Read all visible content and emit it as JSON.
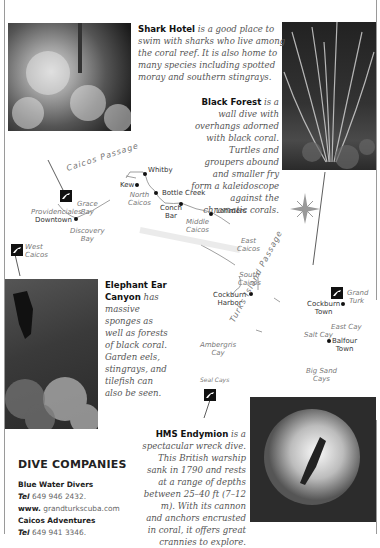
{
  "captions": {
    "shark_hotel": {
      "title": "Shark Hotel",
      "body": "is a good place to swim with sharks who live among the coral reef. It is also home to many species including spotted moray and southern stingrays."
    },
    "black_forest": {
      "title": "Black Forest",
      "body": "is a wall dive with overhangs adorned with black coral. Turtles and groupers abound and smaller fry form a kaleidoscope against the chromatic corals."
    },
    "elephant_ear": {
      "title": "Elephant Ear Canyon",
      "body": "has massive sponges as well as forests of black coral. Garden eels, stingrays, and tilefish can also be seen."
    },
    "hms_endymion": {
      "title": "HMS Endymion",
      "body": "is a spectacular wreck dive. This British warship sank in 1790 and rests at a range of depths between 25–40 ft (7–12 m). With its cannon and anchors encrusted in coral, it offers great crannies to explore."
    }
  },
  "map": {
    "water_labels": {
      "caicos_passage": "Caicos Passage",
      "turks_island_passage": "Turks Island Passage"
    },
    "places": {
      "whitby": "Whitby",
      "kew": "Kew",
      "north_caicos": [
        "North",
        "Caicos"
      ],
      "bottle_creek": "Bottle Creek",
      "conch_bar": [
        "Conch",
        "Bar"
      ],
      "lorimers": "Lorimers",
      "middle_caicos": [
        "Middle",
        "Caicos"
      ],
      "providenciales": "Providenciales",
      "grace_bay": [
        "Grace",
        "Bay"
      ],
      "downtown": "Downtown",
      "discovery_bay": [
        "Discovery",
        "Bay"
      ],
      "west_caicos": [
        "West",
        "Caicos"
      ],
      "east_caicos": [
        "East",
        "Caicos"
      ],
      "south_caicos": [
        "South",
        "Caicos"
      ],
      "cockburn_harbor": [
        "Cockburn",
        "Harbor"
      ],
      "ambergris_cay": [
        "Ambergris",
        "Cay"
      ],
      "seal_cays": "Seal Cays",
      "grand_turk": [
        "Grand",
        "Turk"
      ],
      "cockburn_town": [
        "Cockburn",
        "Town"
      ],
      "east_cay": "East Cay",
      "salt_cay": "Salt Cay",
      "balfour_town": [
        "Balfour",
        "Town"
      ],
      "big_sand_cays": [
        "Big Sand",
        "Cays"
      ]
    }
  },
  "dive_companies": {
    "heading": "DIVE COMPANIES",
    "entries": [
      {
        "name": "Blue Water Divers",
        "tel_label": "Tel",
        "tel": "649 946 2432.",
        "www_label": "www.",
        "www": "grandturkscuba.com"
      },
      {
        "name": "Caicos Adventures",
        "tel_label": "Tel",
        "tel": "649 941 3346."
      }
    ]
  },
  "colors": {
    "text": "#333333",
    "caption": "#555555",
    "label_italic": "#777777",
    "margin_line": "#9a9a9a"
  }
}
